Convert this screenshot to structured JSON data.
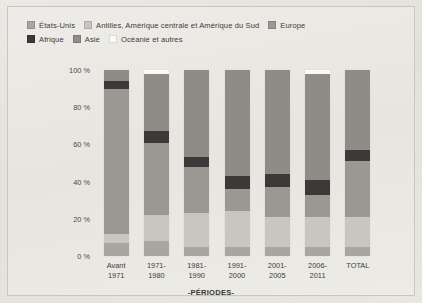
{
  "chart_data": {
    "type": "bar",
    "stacked": true,
    "normalized": "100%",
    "title": "",
    "xlabel": "-PÉRIODES-",
    "ylabel": "",
    "ylim": [
      0,
      100
    ],
    "ytick_labels": [
      "0 %",
      "20 %",
      "40 %",
      "60 %",
      "80 %",
      "100 %"
    ],
    "ytick_values": [
      0,
      20,
      40,
      60,
      80,
      100
    ],
    "grid": false,
    "legend_position": "top-left",
    "categories": [
      "Avant\n1971",
      "1971-\n1980",
      "1981-\n1990",
      "1991-\n2000",
      "2001-\n2005",
      "2006-\n2011",
      "TOTAL"
    ],
    "category_lines": [
      [
        "Avant",
        "1971"
      ],
      [
        "1971-",
        "1980"
      ],
      [
        "1981-",
        "1990"
      ],
      [
        "1991-",
        "2000"
      ],
      [
        "2001-",
        "2005"
      ],
      [
        "2006-",
        "2011"
      ],
      [
        "TOTAL",
        ""
      ]
    ],
    "series": [
      {
        "name": "États-Unis",
        "color": "#a8a6a1",
        "values": [
          7,
          8,
          5,
          5,
          5,
          5,
          5
        ]
      },
      {
        "name": "Antilles, Amérique centrale et Amérique du Sud",
        "color": "#c8c6c1",
        "values": [
          5,
          14,
          18,
          19,
          16,
          16,
          16
        ]
      },
      {
        "name": "Europe",
        "color": "#9a9893",
        "values": [
          78,
          39,
          25,
          12,
          16,
          12,
          30
        ]
      },
      {
        "name": "Afrique",
        "color": "#3b3a38",
        "values": [
          4,
          6,
          5,
          7,
          7,
          8,
          6
        ]
      },
      {
        "name": "Asie",
        "color": "#8e8c87",
        "values": [
          6,
          31,
          47,
          57,
          56,
          57,
          43
        ]
      },
      {
        "name": "Océanie et autres",
        "color": "#fbfaf7",
        "values": [
          0,
          2,
          0,
          0,
          0,
          2,
          0
        ]
      }
    ]
  },
  "legend": {
    "rows": [
      [
        {
          "label": "États-Unis",
          "color": "#a8a6a1"
        },
        {
          "label": "Antilles, Amérique centrale et Amérique du Sud",
          "color": "#c8c6c1"
        },
        {
          "label": "Europe",
          "color": "#9a9893"
        }
      ],
      [
        {
          "label": "Afrique",
          "color": "#3b3a38"
        },
        {
          "label": "Asie",
          "color": "#8e8c87"
        },
        {
          "label": "Océanie et autres",
          "color": "#fbfaf7"
        }
      ]
    ]
  }
}
